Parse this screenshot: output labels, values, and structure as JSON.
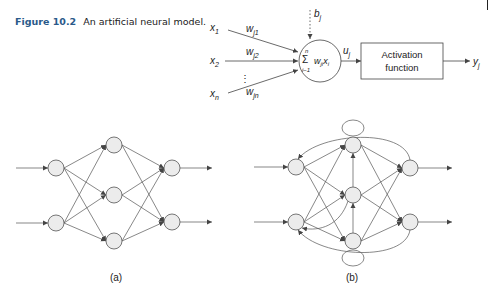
{
  "caption": {
    "figure_number": "Figure 10.2",
    "text": "An artificial neural model."
  },
  "neuron_model": {
    "inputs": [
      "x1",
      "x2",
      "xn"
    ],
    "input_labels": {
      "x1": "x",
      "x1_sub": "1",
      "x2": "x",
      "x2_sub": "2",
      "xn": "x",
      "xn_sub": "n"
    },
    "weights": [
      {
        "base": "w",
        "sub": "j1"
      },
      {
        "base": "w",
        "sub": "j2"
      },
      {
        "base": "w",
        "sub": "jn"
      }
    ],
    "ellipsis": "⋮",
    "bias": {
      "base": "b",
      "sub": "j"
    },
    "summation": {
      "sigma": "Σ",
      "upper": "n",
      "lower": "i−1",
      "term_w": "w",
      "term_w_sub": "ji",
      "term_x": "x",
      "term_x_sub": "i"
    },
    "net_output": {
      "base": "u",
      "sub": "j"
    },
    "activation_box": {
      "line1": "Activation",
      "line2": "function"
    },
    "output": {
      "base": "y",
      "sub": "j"
    }
  },
  "networks": [
    {
      "id": "a",
      "label": "(a)",
      "type": "feedforward",
      "layers": [
        2,
        3,
        2
      ]
    },
    {
      "id": "b",
      "label": "(b)",
      "type": "recurrent",
      "layers": [
        2,
        3,
        2
      ]
    }
  ],
  "colors": {
    "node_fill": "#ececec",
    "stroke": "#555555",
    "caption_accent": "#2a5a8a"
  }
}
